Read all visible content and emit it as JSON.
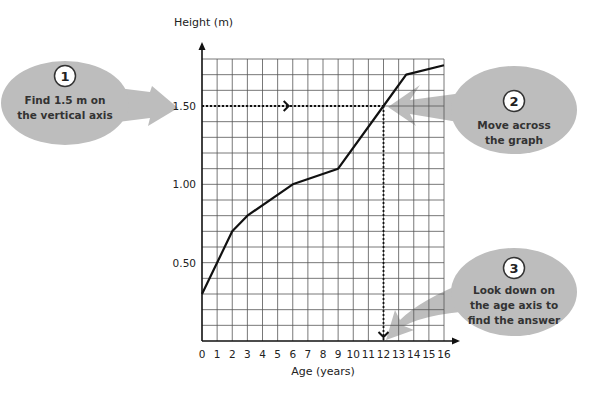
{
  "chart_data": {
    "type": "line",
    "title": "",
    "xlabel": "Age (years)",
    "ylabel": "Height (m)",
    "x_ticks": [
      "0",
      "1",
      "2",
      "3",
      "4",
      "5",
      "6",
      "7",
      "8",
      "9",
      "10",
      "11",
      "12",
      "13",
      "14",
      "15",
      "16"
    ],
    "y_ticks": [
      "0.50",
      "1.00",
      "1.50"
    ],
    "xlim": [
      0,
      16
    ],
    "ylim": [
      0,
      1.8
    ],
    "grid": true,
    "series": [
      {
        "name": "Height",
        "x": [
          0,
          2,
          3,
          6,
          9,
          12,
          13.5,
          16
        ],
        "y": [
          0.3,
          0.7,
          0.8,
          1.0,
          1.1,
          1.5,
          1.7,
          1.76
        ]
      }
    ],
    "annotations": [
      {
        "type": "dotted-line",
        "from": [
          0,
          1.5
        ],
        "to": [
          12,
          1.5
        ]
      },
      {
        "type": "dotted-line",
        "from": [
          12,
          1.5
        ],
        "to": [
          12,
          0
        ]
      },
      {
        "type": "answer",
        "x": 12,
        "y": 1.5
      }
    ]
  },
  "callouts": [
    {
      "number": "1",
      "lines": [
        "Find 1.5 m on",
        "the vertical axis"
      ]
    },
    {
      "number": "2",
      "lines": [
        "Move across",
        "the graph"
      ]
    },
    {
      "number": "3",
      "lines": [
        "Look down on",
        "the age axis to",
        "find the answer"
      ]
    }
  ],
  "colors": {
    "bubble": "#bdbdbd",
    "grid": "#555555",
    "line": "#111111"
  }
}
